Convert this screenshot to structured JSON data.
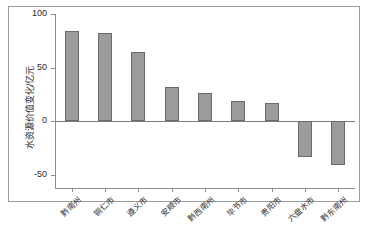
{
  "chart_data": {
    "type": "bar",
    "title": "",
    "xlabel": "",
    "ylabel": "水资源价值变化/亿元",
    "ylim": [
      -62,
      100
    ],
    "yticks": [
      100,
      50,
      0,
      -50
    ],
    "ytick_labels": [
      "100",
      "50",
      "0",
      "-50"
    ],
    "grid": false,
    "legend": null,
    "bar_color": "#9b9b9b",
    "bar_edge_color": "#6a6a6a",
    "categories": [
      "黔南州",
      "铜仁市",
      "遵义市",
      "安顺市",
      "黔西南州",
      "毕节市",
      "贵阳市",
      "六盘水市",
      "黔东南州"
    ],
    "values": [
      84,
      82,
      65,
      32,
      26,
      19,
      17,
      -33,
      -41
    ]
  }
}
